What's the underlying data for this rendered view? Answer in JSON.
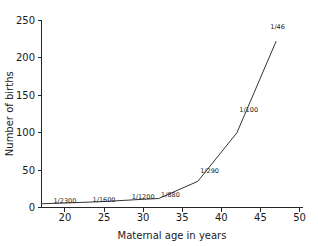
{
  "chart_data": {
    "type": "line",
    "title": "",
    "xlabel": "Maternal age in years",
    "ylabel": "Number of births",
    "xlim": [
      17,
      50.5
    ],
    "ylim": [
      0,
      250
    ],
    "grid": false,
    "legend": "none",
    "xticks": [
      "20",
      "25",
      "30",
      "35",
      "40",
      "45",
      "50"
    ],
    "xtick_values": [
      20,
      25,
      30,
      35,
      40,
      45,
      50
    ],
    "yticks": [
      "0",
      "50",
      "100",
      "150",
      "200",
      "250"
    ],
    "ytick_values": [
      0,
      50,
      100,
      150,
      200,
      250
    ],
    "series": [
      {
        "name": "Number of births",
        "x": [
          17,
          20,
          25,
          30,
          32,
          37,
          42,
          47
        ],
        "values": [
          5,
          6,
          8,
          11,
          12,
          35,
          100,
          222
        ]
      }
    ],
    "annotations": [
      {
        "label": "1/2300",
        "x": 20,
        "y": 6
      },
      {
        "label": "1/1600",
        "x": 25,
        "y": 8
      },
      {
        "label": "1/1200",
        "x": 30,
        "y": 11
      },
      {
        "label": "1/880",
        "x": 33.5,
        "y": 14
      },
      {
        "label": "1/290",
        "x": 38.5,
        "y": 46
      },
      {
        "label": "1/100",
        "x": 43.5,
        "y": 128
      },
      {
        "label": "1/46",
        "x": 47.2,
        "y": 238
      }
    ],
    "colors": {
      "curve": "#333333",
      "axis": "#262626",
      "text": "#1a1a1a",
      "background": "#ffffff"
    }
  }
}
